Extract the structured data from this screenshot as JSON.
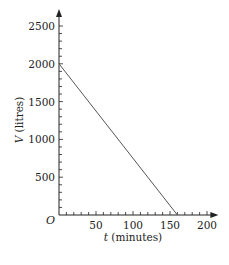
{
  "chart_data": {
    "type": "line",
    "title": "",
    "xlabel": "t (minutes)",
    "xlabel_var": "t",
    "xlabel_unit": "(minutes)",
    "ylabel": "V (litres)",
    "ylabel_var": "V",
    "ylabel_unit": "(litres)",
    "origin_label": "O",
    "x_ticks": [
      50,
      100,
      150,
      200
    ],
    "y_ticks": [
      500,
      1000,
      1500,
      2000,
      2500
    ],
    "xlim": [
      0,
      210
    ],
    "ylim": [
      0,
      2700
    ],
    "grid": false,
    "series": [
      {
        "name": "V",
        "x": [
          0,
          160
        ],
        "y": [
          2000,
          0
        ]
      }
    ]
  }
}
